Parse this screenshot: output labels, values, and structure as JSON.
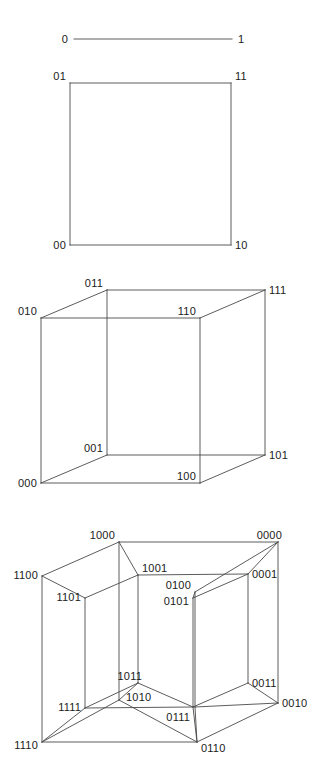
{
  "figure": {
    "background_color": "#ffffff",
    "edge_color": "#4a4a4a",
    "label_color": "#1a1a1a",
    "width": 318,
    "height": 769
  },
  "panels": [
    {
      "id": "q1-line",
      "name": "1-cube (line segment)",
      "dimension": 1,
      "edges": [
        [
          74,
          39,
          232,
          39
        ]
      ],
      "labels": [
        {
          "text": "0",
          "x": 68,
          "y": 43,
          "anchor": "end"
        },
        {
          "text": "1",
          "x": 238,
          "y": 43,
          "anchor": "start"
        }
      ]
    },
    {
      "id": "q2-square",
      "name": "2-cube (square)",
      "dimension": 2,
      "edges": [
        [
          70,
          83,
          231,
          83
        ],
        [
          231,
          83,
          231,
          245
        ],
        [
          231,
          245,
          70,
          245
        ],
        [
          70,
          245,
          70,
          83
        ]
      ],
      "labels": [
        {
          "text": "01",
          "x": 66,
          "y": 80,
          "anchor": "end"
        },
        {
          "text": "11",
          "x": 235,
          "y": 80,
          "anchor": "start"
        },
        {
          "text": "00",
          "x": 66,
          "y": 249,
          "anchor": "end"
        },
        {
          "text": "10",
          "x": 235,
          "y": 249,
          "anchor": "start"
        }
      ]
    },
    {
      "id": "q3-cube",
      "name": "3-cube (cube)",
      "dimension": 3,
      "edges": [
        [
          41,
          318,
          200,
          318
        ],
        [
          200,
          318,
          200,
          483
        ],
        [
          200,
          483,
          41,
          483
        ],
        [
          41,
          483,
          41,
          318
        ],
        [
          107,
          290,
          265,
          290
        ],
        [
          265,
          290,
          265,
          455
        ],
        [
          265,
          455,
          107,
          455
        ],
        [
          107,
          455,
          107,
          290
        ],
        [
          41,
          318,
          107,
          290
        ],
        [
          200,
          318,
          265,
          290
        ],
        [
          200,
          483,
          265,
          455
        ],
        [
          41,
          483,
          107,
          455
        ]
      ],
      "labels": [
        {
          "text": "011",
          "x": 103,
          "y": 287,
          "anchor": "end"
        },
        {
          "text": "111",
          "x": 269,
          "y": 294,
          "anchor": "start"
        },
        {
          "text": "010",
          "x": 37,
          "y": 315,
          "anchor": "end"
        },
        {
          "text": "110",
          "x": 196,
          "y": 315,
          "anchor": "end"
        },
        {
          "text": "001",
          "x": 103,
          "y": 452,
          "anchor": "end"
        },
        {
          "text": "101",
          "x": 269,
          "y": 459,
          "anchor": "start"
        },
        {
          "text": "000",
          "x": 37,
          "y": 487,
          "anchor": "end"
        },
        {
          "text": "100",
          "x": 196,
          "y": 480,
          "anchor": "end"
        }
      ]
    },
    {
      "id": "q4-tesseract",
      "name": "4-cube (tesseract)",
      "dimension": 4,
      "edges": [
        [
          42,
          576,
          119,
          542
        ],
        [
          119,
          542,
          278,
          542
        ],
        [
          278,
          542,
          278,
          703
        ],
        [
          278,
          703,
          197,
          742
        ],
        [
          197,
          742,
          42,
          742
        ],
        [
          42,
          742,
          42,
          576
        ],
        [
          119,
          542,
          119,
          700
        ],
        [
          119,
          700,
          197,
          742
        ],
        [
          119,
          700,
          42,
          742
        ],
        [
          278,
          542,
          195,
          592
        ],
        [
          195,
          592,
          195,
          707
        ],
        [
          195,
          707,
          197,
          742
        ],
        [
          195,
          707,
          278,
          703
        ],
        [
          85,
          598,
          138,
          575
        ],
        [
          138,
          575,
          248,
          574
        ],
        [
          248,
          574,
          248,
          683
        ],
        [
          248,
          683,
          193,
          707
        ],
        [
          193,
          707,
          85,
          708
        ],
        [
          85,
          708,
          85,
          598
        ],
        [
          138,
          575,
          138,
          683
        ],
        [
          138,
          683,
          193,
          707
        ],
        [
          138,
          683,
          85,
          708
        ],
        [
          248,
          574,
          193,
          598
        ],
        [
          193,
          598,
          193,
          707
        ],
        [
          42,
          576,
          85,
          598
        ],
        [
          119,
          542,
          138,
          575
        ],
        [
          278,
          542,
          248,
          574
        ],
        [
          195,
          592,
          193,
          598
        ],
        [
          42,
          742,
          85,
          708
        ],
        [
          119,
          700,
          138,
          683
        ],
        [
          278,
          703,
          248,
          683
        ],
        [
          197,
          742,
          193,
          707
        ]
      ],
      "labels": [
        {
          "text": "1000",
          "x": 115,
          "y": 539,
          "anchor": "end"
        },
        {
          "text": "0000",
          "x": 282,
          "y": 539,
          "anchor": "end"
        },
        {
          "text": "1100",
          "x": 38,
          "y": 579,
          "anchor": "end"
        },
        {
          "text": "1001",
          "x": 142,
          "y": 572,
          "anchor": "start"
        },
        {
          "text": "0001",
          "x": 252,
          "y": 578,
          "anchor": "start"
        },
        {
          "text": "0100",
          "x": 191,
          "y": 589,
          "anchor": "end"
        },
        {
          "text": "1101",
          "x": 81,
          "y": 601,
          "anchor": "end"
        },
        {
          "text": "0101",
          "x": 189,
          "y": 605,
          "anchor": "end"
        },
        {
          "text": "1011",
          "x": 142,
          "y": 680,
          "anchor": "end"
        },
        {
          "text": "0011",
          "x": 252,
          "y": 687,
          "anchor": "start"
        },
        {
          "text": "1010",
          "x": 126,
          "y": 701,
          "anchor": "start"
        },
        {
          "text": "0010",
          "x": 282,
          "y": 707,
          "anchor": "start"
        },
        {
          "text": "1111",
          "x": 81,
          "y": 711,
          "anchor": "end"
        },
        {
          "text": "0111",
          "x": 190,
          "y": 721,
          "anchor": "end"
        },
        {
          "text": "1110",
          "x": 38,
          "y": 749,
          "anchor": "end"
        },
        {
          "text": "0110",
          "x": 201,
          "y": 752,
          "anchor": "start"
        }
      ]
    }
  ]
}
